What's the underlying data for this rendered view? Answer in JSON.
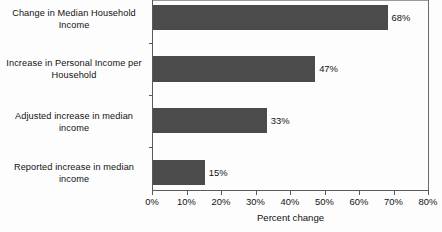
{
  "chart_data": {
    "type": "bar",
    "orientation": "horizontal",
    "title": "",
    "xlabel": "Percent change",
    "ylabel": "",
    "xlim": [
      0,
      80
    ],
    "grid": false,
    "legend": false,
    "bar_color": "#4b4b4b",
    "categories": [
      "Change in Median Household Income",
      "Increase in Personal Income per Household",
      "Adjusted increase in median income",
      "Reported increase in median income"
    ],
    "values": [
      68,
      47,
      33,
      15
    ],
    "value_labels": [
      "68%",
      "47%",
      "33%",
      "15%"
    ],
    "xticks": [
      0,
      10,
      20,
      30,
      40,
      50,
      60,
      70,
      80
    ],
    "xtick_labels": [
      "0%",
      "10%",
      "20%",
      "30%",
      "40%",
      "50%",
      "60%",
      "70%",
      "80%"
    ]
  }
}
